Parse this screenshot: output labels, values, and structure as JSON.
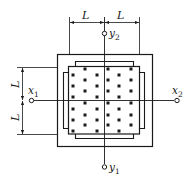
{
  "diagram": {
    "dimension_label": "L",
    "top_dimension": {
      "left_label": "L",
      "right_label": "L"
    },
    "left_dimension": {
      "upper_label": "L",
      "lower_label": "L"
    },
    "points": {
      "x1": {
        "base": "x",
        "sub": "1"
      },
      "x2": {
        "base": "x",
        "sub": "2"
      },
      "y1": {
        "base": "y",
        "sub": "1"
      },
      "y2": {
        "base": "y",
        "sub": "2"
      }
    },
    "colors": {
      "line": "#1a1a1a",
      "background": "#ffffff"
    },
    "dot_rows": [
      {
        "y": 69,
        "xs": [
          85,
          108,
          131
        ]
      },
      {
        "y": 75,
        "xs": [
          73,
          97,
          119
        ]
      },
      {
        "y": 80,
        "xs": [
          85,
          108,
          131
        ]
      },
      {
        "y": 86,
        "xs": [
          73,
          97,
          119
        ]
      },
      {
        "y": 91,
        "xs": [
          85,
          108,
          131
        ]
      },
      {
        "y": 97,
        "xs": [
          73,
          97,
          119
        ]
      },
      {
        "y": 103,
        "xs": [
          85,
          108,
          131
        ]
      },
      {
        "y": 109,
        "xs": [
          73,
          97,
          119
        ]
      },
      {
        "y": 115,
        "xs": [
          85,
          108,
          131
        ]
      },
      {
        "y": 120,
        "xs": [
          73,
          97,
          119
        ]
      },
      {
        "y": 125,
        "xs": [
          85,
          108,
          131
        ]
      },
      {
        "y": 131,
        "xs": [
          73,
          97,
          119
        ]
      }
    ]
  }
}
